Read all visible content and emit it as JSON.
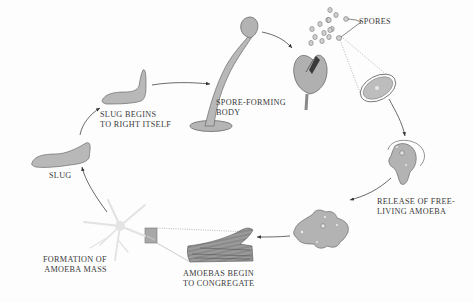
{
  "diagram": {
    "type": "life-cycle",
    "colors": {
      "fill": "#bdbdbd",
      "fill_light": "#cfcfcf",
      "stroke": "#5a5a5a",
      "arrow": "#4a4a4a",
      "dotted": "#8a8a8a",
      "text": "#3a3a3a",
      "mass": "#e4e4e4"
    },
    "stages": [
      {
        "id": "spore-forming-body",
        "label_line1": "SPORE-FORMING",
        "label_line2": "BODY"
      },
      {
        "id": "spores",
        "label_line1": "SPORES"
      },
      {
        "id": "release",
        "label_line1": "RELEASE OF FREE-",
        "label_line2": "LIVING AMOEBA"
      },
      {
        "id": "congregate",
        "label_line1": "AMOEBAS BEGIN",
        "label_line2": "TO CONGREGATE"
      },
      {
        "id": "amoeba-mass",
        "label_line1": "FORMATION OF",
        "label_line2": "AMOEBA MASS"
      },
      {
        "id": "slug",
        "label_line1": "SLUG"
      },
      {
        "id": "slug-rights",
        "label_line1": "SLUG BEGINS",
        "label_line2": "TO RIGHT ITSELF"
      }
    ]
  }
}
